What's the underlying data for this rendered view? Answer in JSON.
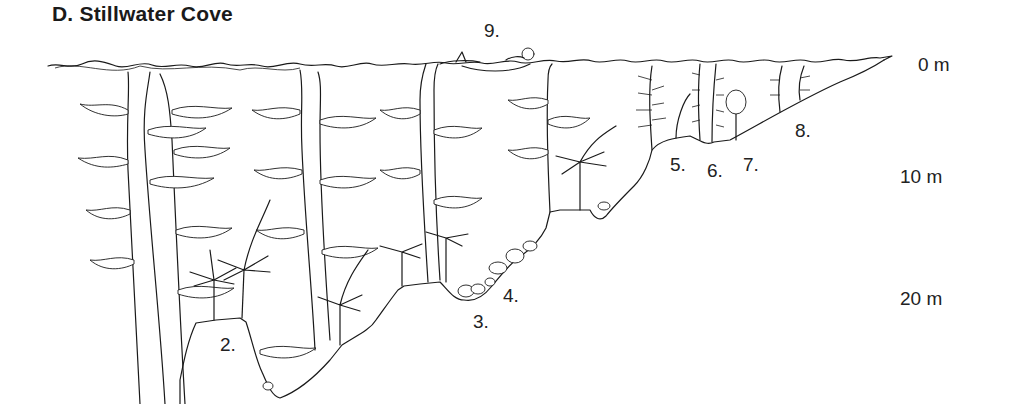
{
  "figure": {
    "title": "D.  Stillwater Cove",
    "depth_scale": [
      {
        "label": "0 m",
        "x": 918,
        "y": 54
      },
      {
        "label": "10 m",
        "x": 900,
        "y": 166
      },
      {
        "label": "20 m",
        "x": 900,
        "y": 288
      }
    ],
    "zone_labels": [
      {
        "label": "2.",
        "x": 220,
        "y": 334
      },
      {
        "label": "3.",
        "x": 473,
        "y": 311
      },
      {
        "label": "4.",
        "x": 503,
        "y": 285
      },
      {
        "label": "5.",
        "x": 670,
        "y": 154
      },
      {
        "label": "6.",
        "x": 707,
        "y": 160
      },
      {
        "label": "7.",
        "x": 743,
        "y": 154
      },
      {
        "label": "8.",
        "x": 795,
        "y": 120
      },
      {
        "label": "9.",
        "x": 484,
        "y": 20
      }
    ],
    "colors": {
      "ink": "#1a1a1a",
      "background": "#ffffff"
    }
  }
}
